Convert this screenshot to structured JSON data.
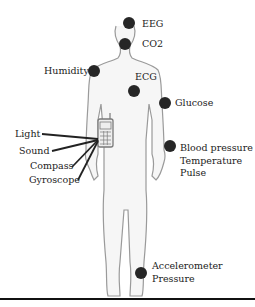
{
  "diagram": {
    "sensor_color": "#262626",
    "body_outline_color": "#9a9a9a",
    "body_fill_color": "#f6f6f6",
    "phone_color": "#7a7a7a",
    "body_sensors": [
      {
        "id": "eeg",
        "labels": [
          "EEG"
        ]
      },
      {
        "id": "co2",
        "labels": [
          "CO2"
        ]
      },
      {
        "id": "humidity",
        "labels": [
          "Humidity"
        ]
      },
      {
        "id": "ecg",
        "labels": [
          "ECG"
        ]
      },
      {
        "id": "glucose",
        "labels": [
          "Glucose"
        ]
      },
      {
        "id": "wrist",
        "labels": [
          "Blood pressure",
          "Temperature",
          "Pulse"
        ]
      },
      {
        "id": "ankle",
        "labels": [
          "Accelerometer",
          "Pressure"
        ]
      }
    ],
    "phone_sensors": [
      "Light",
      "Sound",
      "Compass",
      "Gyroscope"
    ]
  }
}
